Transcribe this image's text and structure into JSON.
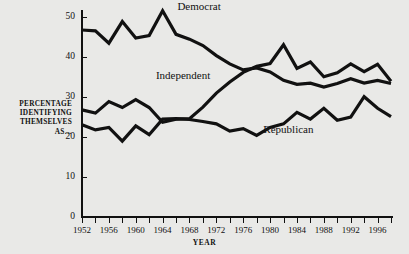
{
  "chart_data": {
    "type": "line",
    "title": "",
    "xlabel": "YEAR",
    "ylabel": "PERCENTAGE IDENTIFYING THEMSELVES AS…",
    "ylabel_lines": [
      "PERCENTAGE",
      "IDENTIFYING",
      "THEMSELVES",
      "AS…"
    ],
    "xlim": [
      1952,
      1998
    ],
    "ylim": [
      0,
      52
    ],
    "grid": false,
    "legend": "inline-labels",
    "y_ticks": [
      0,
      10,
      20,
      30,
      40,
      50
    ],
    "y_tick_labels": [
      "0",
      "10",
      "20",
      "30",
      "40",
      "50"
    ],
    "x_ticks": [
      1952,
      1954,
      1956,
      1958,
      1960,
      1962,
      1964,
      1966,
      1968,
      1970,
      1972,
      1974,
      1976,
      1978,
      1980,
      1982,
      1984,
      1986,
      1988,
      1990,
      1992,
      1994,
      1996,
      1998
    ],
    "x_tick_labels": [
      "1952",
      "1956",
      "1960",
      "1964",
      "1968",
      "1972",
      "1976",
      "1980",
      "1984",
      "1988",
      "1992",
      "1996"
    ],
    "x_tick_label_years": [
      1952,
      1956,
      1960,
      1964,
      1968,
      1972,
      1976,
      1980,
      1984,
      1988,
      1992,
      1996
    ],
    "x": [
      1952,
      1954,
      1956,
      1958,
      1960,
      1962,
      1964,
      1966,
      1968,
      1970,
      1972,
      1974,
      1976,
      1978,
      1980,
      1982,
      1984,
      1986,
      1988,
      1990,
      1992,
      1994,
      1996,
      1998
    ],
    "line_color": "#111111",
    "line_width": 3.2,
    "background": "#e9e9e7",
    "series": [
      {
        "name": "Democrat",
        "label_x": 1966.2,
        "label_y": 52.6,
        "values": [
          46.8,
          46.6,
          43.5,
          48.9,
          44.8,
          45.4,
          51.6,
          45.7,
          44.5,
          42.9,
          40.4,
          38.3,
          36.8,
          37.3,
          36.3,
          34.2,
          33.2,
          33.5,
          32.5,
          33.4,
          34.6,
          33.5,
          34.2,
          33.4
        ]
      },
      {
        "name": "Independent",
        "label_x": 1963.0,
        "label_y": 35.4,
        "values": [
          26.8,
          26.0,
          28.9,
          27.4,
          29.4,
          27.4,
          23.7,
          24.5,
          24.6,
          27.5,
          31.0,
          33.8,
          36.2,
          37.7,
          38.4,
          43.1,
          37.2,
          38.8,
          35.1,
          36.1,
          38.3,
          36.4,
          38.2,
          34.0
        ]
      },
      {
        "name": "Republican",
        "label_x": 1979.0,
        "label_y": 21.7,
        "values": [
          23.1,
          21.8,
          22.4,
          19.0,
          22.8,
          20.6,
          24.5,
          24.6,
          24.4,
          23.9,
          23.3,
          21.5,
          22.1,
          20.4,
          22.4,
          23.3,
          26.2,
          24.5,
          27.2,
          24.2,
          25.0,
          30.1,
          27.2,
          25.1
        ]
      }
    ]
  }
}
